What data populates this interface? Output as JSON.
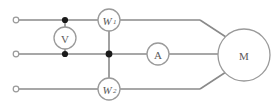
{
  "diagram": {
    "type": "electrical-schematic",
    "background_color": "#ffffff",
    "wire_color": "#8a8a8a",
    "label_color": "#5a5a5a",
    "junction_color": "#1a1a1a",
    "terminals": [
      {
        "id": "terminal-top",
        "label": "",
        "x": 16,
        "y": 20
      },
      {
        "id": "terminal-middle",
        "label": "",
        "x": 16,
        "y": 54
      },
      {
        "id": "terminal-bottom",
        "label": "",
        "x": 16,
        "y": 89
      }
    ],
    "components": [
      {
        "id": "voltmeter",
        "symbol": "V",
        "subscript": "",
        "name": "voltmeter",
        "cx": 65,
        "cy": 38,
        "r": 11,
        "italic": false
      },
      {
        "id": "wattmeter-1",
        "symbol": "W",
        "subscript": "1",
        "name": "wattmeter-one",
        "cx": 109,
        "cy": 20,
        "r": 11,
        "italic": true
      },
      {
        "id": "wattmeter-2",
        "symbol": "W",
        "subscript": "2",
        "name": "wattmeter-two",
        "cx": 109,
        "cy": 89,
        "r": 11,
        "italic": true
      },
      {
        "id": "ammeter",
        "symbol": "A",
        "subscript": "",
        "name": "ammeter",
        "cx": 158,
        "cy": 54,
        "r": 11,
        "italic": false
      },
      {
        "id": "motor",
        "symbol": "M",
        "subscript": "",
        "name": "motor",
        "cx": 244,
        "cy": 55,
        "r": 26,
        "italic": false
      }
    ],
    "junctions": [
      {
        "id": "junction-top-voltmeter",
        "x": 65,
        "y": 20
      },
      {
        "id": "junction-middle-voltmeter",
        "x": 65,
        "y": 54
      },
      {
        "id": "junction-middle-wattmeter",
        "x": 109,
        "y": 54
      }
    ],
    "lines": {
      "top_line_y": 20,
      "middle_line_y": 54,
      "bottom_line_y": 89,
      "left_edge_x": 16,
      "bend_x": 200,
      "motor_left_x": 218
    }
  }
}
